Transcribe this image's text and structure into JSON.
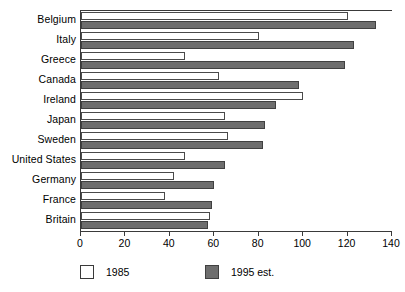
{
  "chart_data": {
    "type": "bar",
    "orientation": "horizontal",
    "title": "",
    "xlabel": "",
    "ylabel": "",
    "xlim": [
      0,
      140
    ],
    "xticks": [
      0,
      20,
      40,
      60,
      80,
      100,
      120,
      140
    ],
    "grid": false,
    "legend_position": "bottom",
    "categories": [
      "Belgium",
      "Italy",
      "Greece",
      "Canada",
      "Ireland",
      "Japan",
      "Sweden",
      "United States",
      "Germany",
      "France",
      "Britain"
    ],
    "series": [
      {
        "name": "1985",
        "color": "#ffffff",
        "values": [
          120,
          80,
          47,
          62,
          100,
          65,
          66,
          47,
          42,
          38,
          58
        ]
      },
      {
        "name": "1995 est.",
        "color": "#6e6e6e",
        "values": [
          133,
          123,
          119,
          98,
          88,
          83,
          82,
          65,
          60,
          59,
          57
        ]
      }
    ]
  },
  "legend": {
    "items": [
      {
        "label": "1985"
      },
      {
        "label": "1995 est."
      }
    ]
  },
  "colors": {
    "bar_1985_fill": "#ffffff",
    "bar_1985_border": "#4a4a4a",
    "bar_1995_fill": "#6e6e6e",
    "bar_1995_border": "#404040",
    "axis": "#3a3a3a",
    "background": "#ffffff"
  }
}
